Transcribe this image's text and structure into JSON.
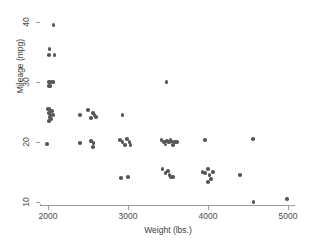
{
  "chart_data": {
    "type": "scatter",
    "title": "",
    "xlabel": "Weight (lbs.)",
    "ylabel": "Mileage (mpg)",
    "xlim": [
      1700,
      5100
    ],
    "ylim": [
      9,
      41.5
    ],
    "xticks": [
      2000,
      3000,
      4000,
      5000
    ],
    "xtick_labels": [
      "2000",
      "3000",
      "4000",
      "5000"
    ],
    "yticks": [
      10,
      20,
      30,
      40
    ],
    "ytick_labels": [
      "10",
      "20",
      "30",
      "40"
    ],
    "grid": false,
    "legend": "none",
    "marker_color": "#575757",
    "axis_color": "#9a9a9a",
    "background": "#ffffff",
    "series": [
      {
        "name": "automobiles",
        "marker": "circle",
        "points": [
          [
            2070,
            39.5
          ],
          [
            2020,
            35.5
          ],
          [
            2010,
            34.5
          ],
          [
            2080,
            34.5
          ],
          [
            2010,
            30.0
          ],
          [
            2020,
            30.0
          ],
          [
            2050,
            30.0
          ],
          [
            2070,
            30.0
          ],
          [
            2010,
            29.3
          ],
          [
            2030,
            29.3
          ],
          [
            2000,
            25.5
          ],
          [
            2020,
            25.5
          ],
          [
            2050,
            25.2
          ],
          [
            2010,
            24.8
          ],
          [
            2030,
            24.5
          ],
          [
            2060,
            24.5
          ],
          [
            2020,
            24.2
          ],
          [
            2040,
            23.8
          ],
          [
            2010,
            23.5
          ],
          [
            1990,
            19.7
          ],
          [
            2400,
            24.5
          ],
          [
            2500,
            25.3
          ],
          [
            2560,
            24.8
          ],
          [
            2580,
            24.5
          ],
          [
            2540,
            24.0
          ],
          [
            2600,
            24.2
          ],
          [
            2400,
            19.8
          ],
          [
            2540,
            20.2
          ],
          [
            2570,
            19.8
          ],
          [
            2560,
            19.2
          ],
          [
            2930,
            24.5
          ],
          [
            2900,
            20.3
          ],
          [
            2930,
            20.0
          ],
          [
            2960,
            19.5
          ],
          [
            2990,
            20.5
          ],
          [
            3020,
            20.0
          ],
          [
            3030,
            19.5
          ],
          [
            2910,
            14.0
          ],
          [
            3000,
            14.2
          ],
          [
            3480,
            30.0
          ],
          [
            3420,
            20.3
          ],
          [
            3450,
            20.0
          ],
          [
            3470,
            19.6
          ],
          [
            3490,
            20.2
          ],
          [
            3510,
            19.9
          ],
          [
            3530,
            20.3
          ],
          [
            3550,
            20.1
          ],
          [
            3560,
            19.5
          ],
          [
            3590,
            20.0
          ],
          [
            3610,
            20.0
          ],
          [
            3430,
            15.5
          ],
          [
            3470,
            14.8
          ],
          [
            3500,
            15.2
          ],
          [
            3520,
            14.5
          ],
          [
            3540,
            14.2
          ],
          [
            3560,
            14.2
          ],
          [
            3960,
            20.3
          ],
          [
            3930,
            15.0
          ],
          [
            3960,
            14.8
          ],
          [
            4000,
            15.5
          ],
          [
            4020,
            14.5
          ],
          [
            4060,
            15.0
          ],
          [
            4040,
            13.8
          ],
          [
            4000,
            13.3
          ],
          [
            4400,
            14.5
          ],
          [
            4560,
            20.5
          ],
          [
            4570,
            10.0
          ],
          [
            4990,
            10.5
          ]
        ]
      }
    ]
  }
}
